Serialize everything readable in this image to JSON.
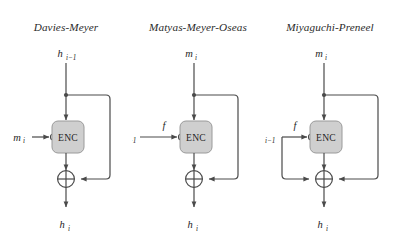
{
  "figure": {
    "background_color": "#ffffff",
    "line_color": "#4a4a4a",
    "box_fill_color": "#cfcfcf",
    "box_stroke_color": "#8f8f8f",
    "text_color": "#262626"
  },
  "panels": [
    {
      "id": "davies-meyer",
      "title": "Davies-Meyer",
      "top_input": {
        "base": "h",
        "sub": "i−1",
        "text": "h i−1"
      },
      "side_input": {
        "base": "m",
        "sub": "i",
        "text": "m i"
      },
      "side_input_prefix": "",
      "output": {
        "base": "h",
        "sub": "i",
        "text": "h i"
      },
      "cipher_label": "ENC",
      "xor_symbol": "⊕",
      "feedback": "top-input-right"
    },
    {
      "id": "matyas-meyer-oseas",
      "title": "Matyas-Meyer-Oseas",
      "top_input": {
        "base": "m",
        "sub": "i",
        "text": "m i"
      },
      "side_input": {
        "base": "h",
        "sub": "i−1",
        "text": "h i−1"
      },
      "side_input_prefix": "f",
      "output": {
        "base": "h",
        "sub": "i",
        "text": "h i"
      },
      "cipher_label": "ENC",
      "xor_symbol": "⊕",
      "feedback": "top-input-right"
    },
    {
      "id": "miyaguchi-preneel",
      "title": "Miyaguchi-Preneel",
      "top_input": {
        "base": "m",
        "sub": "i",
        "text": "m i"
      },
      "side_input": {
        "base": "h",
        "sub": "i−1",
        "text": "h i−1"
      },
      "side_input_prefix": "f",
      "output": {
        "base": "h",
        "sub": "i",
        "text": "h i"
      },
      "cipher_label": "ENC",
      "xor_symbol": "⊕",
      "feedback": "top-input-right-and-side-input-left"
    }
  ]
}
